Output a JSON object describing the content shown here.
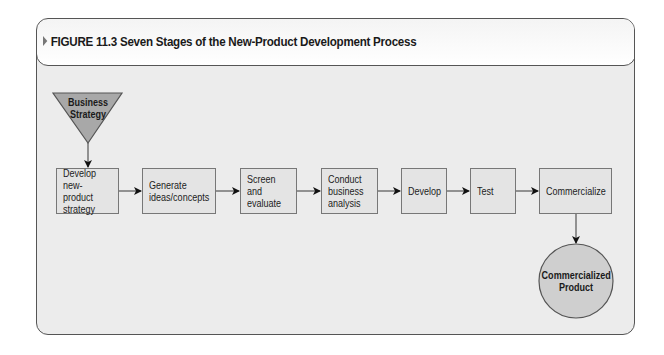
{
  "figure": {
    "title": "FIGURE 11.3 Seven Stages of the New-Product Development Process",
    "marker_icon": "triangle-right-icon"
  },
  "diagram": {
    "input": {
      "label": "Business\nStrategy",
      "shape": "inverted-triangle",
      "fill": "#a8a8a8"
    },
    "stages": [
      {
        "label": "Develop\nnew-product\nstrategy"
      },
      {
        "label": "Generate\nideas/concepts"
      },
      {
        "label": "Screen and\nevaluate"
      },
      {
        "label": "Conduct\nbusiness\nanalysis"
      },
      {
        "label": "Develop"
      },
      {
        "label": "Test"
      },
      {
        "label": "Commercialize"
      }
    ],
    "output": {
      "label": "Commercialized\nProduct",
      "shape": "circle",
      "fill": "#cfcfcf"
    },
    "colors": {
      "box_fill": "#e4e4e4",
      "border": "#777777",
      "background": "#ececec"
    }
  }
}
